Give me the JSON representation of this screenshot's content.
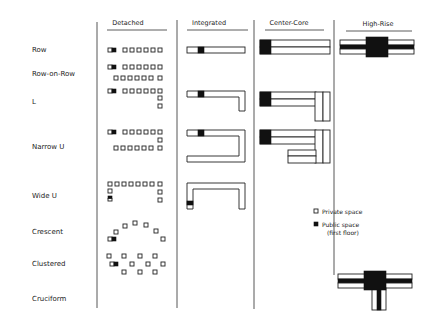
{
  "columns": [
    {
      "id": "detached",
      "label": "Detached"
    },
    {
      "id": "integrated",
      "label": "Integrated"
    },
    {
      "id": "center_core",
      "label": "Center-Core"
    },
    {
      "id": "high_rise",
      "label": "High-Rise"
    }
  ],
  "rows": [
    {
      "id": "row",
      "label": "Row"
    },
    {
      "id": "row_on_row",
      "label": "Row-on-Row"
    },
    {
      "id": "l",
      "label": "L"
    },
    {
      "id": "narrow_u",
      "label": "Narrow U"
    },
    {
      "id": "wide_u",
      "label": "Wide U"
    },
    {
      "id": "crescent",
      "label": "Crescent"
    },
    {
      "id": "clustered",
      "label": "Clustered"
    },
    {
      "id": "cruciform",
      "label": "Cruciform"
    }
  ],
  "legend": {
    "private": {
      "label": "Private space",
      "icon": "white-square-icon"
    },
    "public": {
      "label": "Public space",
      "sublabel": "(first floor)",
      "icon": "black-square-icon"
    }
  },
  "colors": {
    "private": "#ffffff",
    "public": "#111111",
    "stroke": "#222222"
  }
}
